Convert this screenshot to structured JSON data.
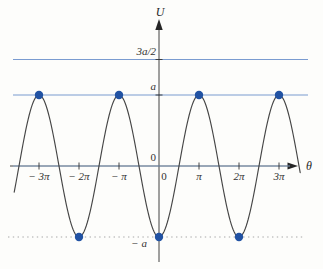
{
  "chart_data": {
    "type": "line",
    "title": "",
    "xlabel": "θ",
    "ylabel": "U",
    "x_units": "radians (labeled in multiples of π)",
    "y_units": "multiples of a",
    "grid": false,
    "legend": false,
    "xlim_pi": [
      -3.75,
      4.0
    ],
    "ylim_a": [
      -1.45,
      2.1
    ],
    "curve": {
      "function": "U(θ) = −a·cos θ",
      "amplitude_a": 1,
      "theta_min_pi": -3.62,
      "theta_max_pi": 3.53,
      "color": "#454545"
    },
    "x_ticks": [
      {
        "value_pi": -3,
        "label": "− 3π"
      },
      {
        "value_pi": -2,
        "label": "− 2π"
      },
      {
        "value_pi": -1,
        "label": "− π"
      },
      {
        "value_pi": 0,
        "label": "0"
      },
      {
        "value_pi": 1,
        "label": "π"
      },
      {
        "value_pi": 2,
        "label": "2π"
      },
      {
        "value_pi": 3,
        "label": "3π"
      }
    ],
    "y_ticks": [
      {
        "value_a": 1.5,
        "label": "3a/2"
      },
      {
        "value_a": 1,
        "label": "a"
      },
      {
        "value_a": 0,
        "label": "0"
      },
      {
        "value_a": -1,
        "label": "− a"
      }
    ],
    "energy_levels": [
      {
        "value_a": 1.5,
        "style": "solid",
        "color": "#7a9bd0"
      },
      {
        "value_a": 1,
        "style": "solid",
        "color": "#7a9bd0"
      },
      {
        "value_a": 0,
        "style": "solid",
        "color": "#8fb2dd"
      },
      {
        "value_a": -1,
        "style": "dotted",
        "color": "#c4c4c4"
      }
    ],
    "marked_points": {
      "color": "#2152a3",
      "maxima": {
        "theta_pi": [
          -3,
          -1,
          1,
          3
        ],
        "value_a": 1
      },
      "minima": {
        "theta_pi": [
          -2,
          0,
          2
        ],
        "value_a": -1
      }
    }
  }
}
